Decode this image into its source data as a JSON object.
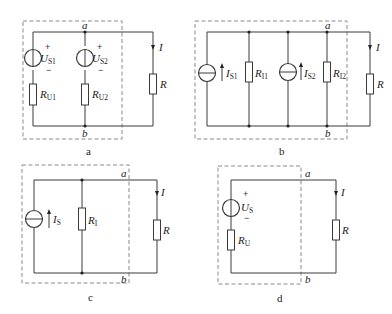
{
  "figure": {
    "panels": [
      {
        "id": "a",
        "caption": "a",
        "nodes": {
          "top": "a",
          "bottom": "b"
        },
        "current_label": "I",
        "load": {
          "name": "R"
        },
        "sources": [
          {
            "type": "voltage",
            "symbol": "U",
            "sub": "S1",
            "plus": "+",
            "minus": "−",
            "series_resistor": {
              "symbol": "R",
              "sub": "U1"
            }
          },
          {
            "type": "voltage",
            "symbol": "U",
            "sub": "S2",
            "plus": "+",
            "minus": "−",
            "series_resistor": {
              "symbol": "R",
              "sub": "U2"
            }
          }
        ]
      },
      {
        "id": "b",
        "caption": "b",
        "nodes": {
          "top": "a",
          "bottom": "b"
        },
        "current_label": "I",
        "load": {
          "name": "R"
        },
        "sources": [
          {
            "type": "current",
            "symbol": "I",
            "sub": "S1",
            "parallel_resistor": {
              "symbol": "R",
              "sub": "I1"
            }
          },
          {
            "type": "current",
            "symbol": "I",
            "sub": "S2",
            "parallel_resistor": {
              "symbol": "R",
              "sub": "I2"
            }
          }
        ]
      },
      {
        "id": "c",
        "caption": "c",
        "nodes": {
          "top": "a",
          "bottom": "b"
        },
        "current_label": "I",
        "load": {
          "name": "R"
        },
        "sources": [
          {
            "type": "current",
            "symbol": "I",
            "sub": "S",
            "parallel_resistor": {
              "symbol": "R",
              "sub": "I"
            }
          }
        ]
      },
      {
        "id": "d",
        "caption": "d",
        "nodes": {
          "top": "a",
          "bottom": "b"
        },
        "current_label": "I",
        "load": {
          "name": "R"
        },
        "sources": [
          {
            "type": "voltage",
            "symbol": "U",
            "sub": "S",
            "plus": "+",
            "minus": "−",
            "series_resistor": {
              "symbol": "R",
              "sub": "U"
            }
          }
        ]
      }
    ]
  }
}
